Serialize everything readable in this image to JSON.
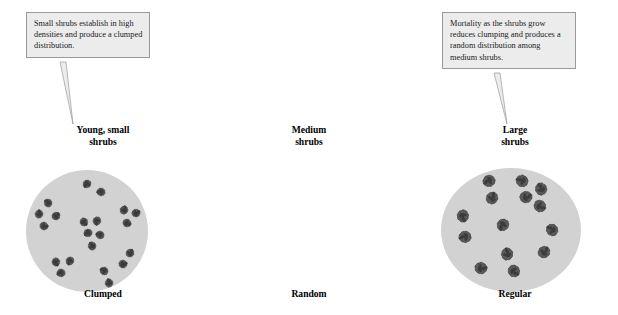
{
  "figure": {
    "background": "#ffffff",
    "quadrat_fill": "#d2d2d2",
    "shrub_fill": "#5a5a5a",
    "shrub_stroke": "#3c3c3c",
    "callout_fill": "#ececed",
    "callout_border": "#9a9a9a"
  },
  "panels": [
    {
      "callout": "Small shrubs establish in high densities and produce a clumped distribution.",
      "heading_line1": "Young, small",
      "heading_line2": "shrubs",
      "label": "Clumped",
      "shrub_size": 9,
      "shrubs": [
        {
          "x": 61,
          "y": 14
        },
        {
          "x": 75,
          "y": 22
        },
        {
          "x": 22,
          "y": 33
        },
        {
          "x": 13,
          "y": 44
        },
        {
          "x": 30,
          "y": 46
        },
        {
          "x": 18,
          "y": 56
        },
        {
          "x": 58,
          "y": 52
        },
        {
          "x": 71,
          "y": 51
        },
        {
          "x": 62,
          "y": 63
        },
        {
          "x": 74,
          "y": 65
        },
        {
          "x": 66,
          "y": 76
        },
        {
          "x": 98,
          "y": 40
        },
        {
          "x": 110,
          "y": 43
        },
        {
          "x": 101,
          "y": 53
        },
        {
          "x": 30,
          "y": 92
        },
        {
          "x": 44,
          "y": 91
        },
        {
          "x": 35,
          "y": 103
        },
        {
          "x": 78,
          "y": 101
        },
        {
          "x": 83,
          "y": 113
        },
        {
          "x": 104,
          "y": 83
        },
        {
          "x": 97,
          "y": 94
        }
      ]
    },
    {
      "callout": "Mortality as the shrubs grow reduces clumping and produces a random distribution among medium shrubs.",
      "heading_line1": "Medium",
      "heading_line2": "shrubs",
      "label": "Random",
      "shrub_size": 13,
      "shrubs": [
        {
          "x": 48,
          "y": 13
        },
        {
          "x": 81,
          "y": 13
        },
        {
          "x": 100,
          "y": 21
        },
        {
          "x": 51,
          "y": 30
        },
        {
          "x": 85,
          "y": 29
        },
        {
          "x": 99,
          "y": 38
        },
        {
          "x": 22,
          "y": 48
        },
        {
          "x": 62,
          "y": 57
        },
        {
          "x": 24,
          "y": 69
        },
        {
          "x": 111,
          "y": 62
        },
        {
          "x": 66,
          "y": 86
        },
        {
          "x": 103,
          "y": 84
        },
        {
          "x": 40,
          "y": 100
        },
        {
          "x": 73,
          "y": 103
        }
      ]
    },
    {
      "callout": "Competition enforces a regular distribution among large shrubs.",
      "heading_line1": "Large",
      "heading_line2": "shrubs",
      "label": "Regular",
      "shrub_size": 21,
      "shrubs": [
        {
          "x": 41,
          "y": 35
        },
        {
          "x": 74,
          "y": 25
        },
        {
          "x": 106,
          "y": 21
        },
        {
          "x": 31,
          "y": 70
        },
        {
          "x": 69,
          "y": 60
        },
        {
          "x": 108,
          "y": 53
        },
        {
          "x": 48,
          "y": 100
        },
        {
          "x": 93,
          "y": 92
        }
      ]
    }
  ]
}
